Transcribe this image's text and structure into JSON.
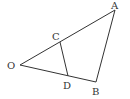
{
  "diagram": {
    "type": "geometry",
    "points": {
      "O": {
        "label": "O",
        "x": 20,
        "y": 65
      },
      "A": {
        "label": "A",
        "x": 115,
        "y": 10
      },
      "B": {
        "label": "B",
        "x": 96,
        "y": 82
      },
      "C": {
        "label": "C",
        "x": 60,
        "y": 42
      },
      "D": {
        "label": "D",
        "x": 68,
        "y": 76
      }
    },
    "segments": [
      [
        "O",
        "A"
      ],
      [
        "O",
        "B"
      ],
      [
        "A",
        "B"
      ],
      [
        "C",
        "D"
      ]
    ],
    "labels": {
      "A": "A",
      "B": "B",
      "C": "C",
      "D": "D",
      "O": "O"
    },
    "colors": {
      "line": "#333333",
      "background": "#ffffff"
    }
  }
}
